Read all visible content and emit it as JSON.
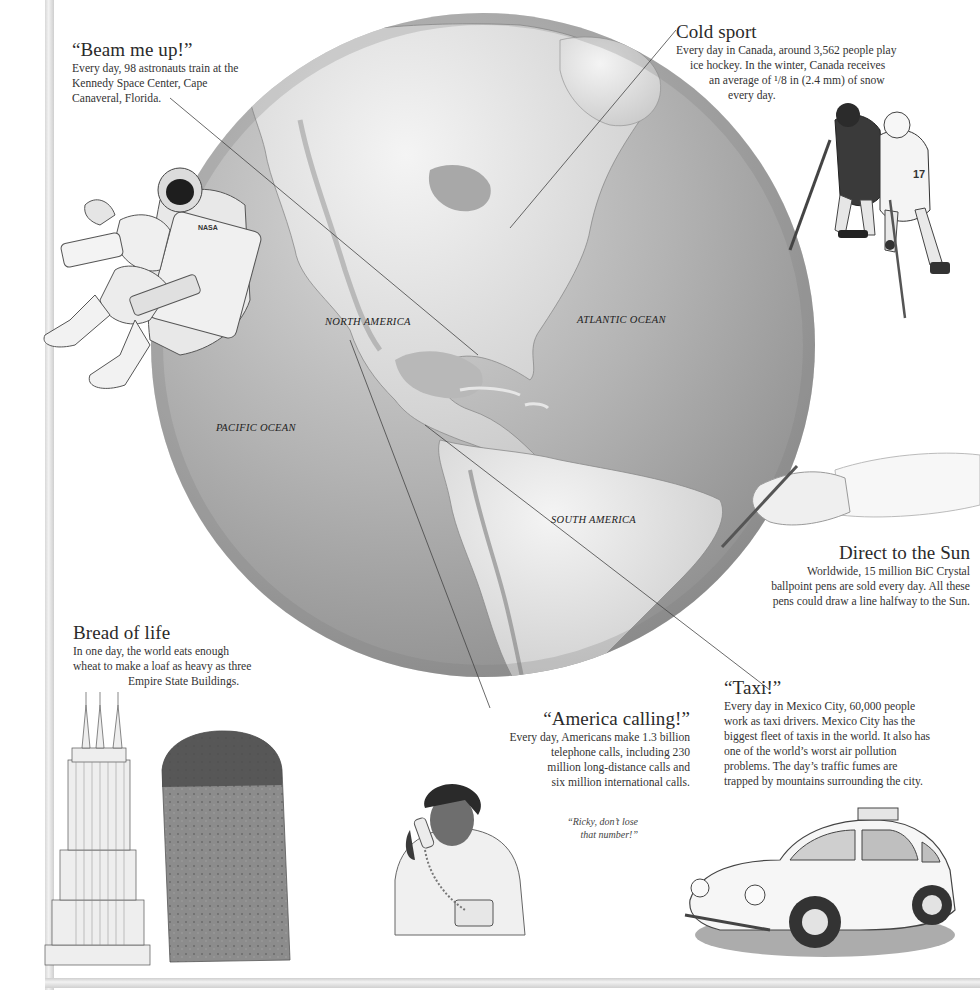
{
  "page": {
    "frame_color": "#dcdcdc",
    "globe_shade": "#9a9a9a"
  },
  "map_labels": {
    "north_america": "NORTH AMERICA",
    "atlantic_ocean": "ATLANTIC OCEAN",
    "pacific_ocean": "PACIFIC OCEAN",
    "south_america": "SOUTH AMERICA"
  },
  "captions": {
    "beam": {
      "title": "“Beam me up!”",
      "lines": [
        "Every day, 98 astronauts train at the",
        "Kennedy Space Center, Cape",
        "Canaveral, Florida."
      ]
    },
    "cold": {
      "title": "Cold sport",
      "lines": [
        "Every day in Canada, around 3,562 people play",
        "ice hockey. In the winter, Canada receives",
        "an average of ¹/8 in (2.4 mm) of snow",
        "every day."
      ]
    },
    "sun": {
      "title": "Direct to the Sun",
      "lines": [
        "Worldwide, 15 million BiC Crystal",
        "ballpoint pens are sold every day. All these",
        "pens could draw a line halfway to the Sun."
      ]
    },
    "bread": {
      "title": "Bread of life",
      "lines": [
        "In one day, the world eats enough",
        "wheat to make a loaf as heavy as three",
        "Empire State Buildings."
      ]
    },
    "america": {
      "title": "“America calling!”",
      "lines": [
        "Every day, Americans make 1.3 billion",
        "telephone calls, including 230",
        "million long-distance calls and",
        "six million international calls."
      ]
    },
    "taxi": {
      "title": "“Taxi!”",
      "lines": [
        "Every day in Mexico City, 60,000 people",
        "work as taxi drivers. Mexico City has the",
        "biggest fleet of taxis in the world. It also has",
        "one of the world’s worst air pollution",
        "problems. The day’s traffic fumes are",
        "trapped by mountains surrounding the city."
      ]
    }
  },
  "quote": {
    "lines": [
      "“Ricky, don’t lose",
      "that number!”"
    ]
  },
  "illustrations": {
    "astronaut_badge": "NASA",
    "hockey_number": "17"
  }
}
